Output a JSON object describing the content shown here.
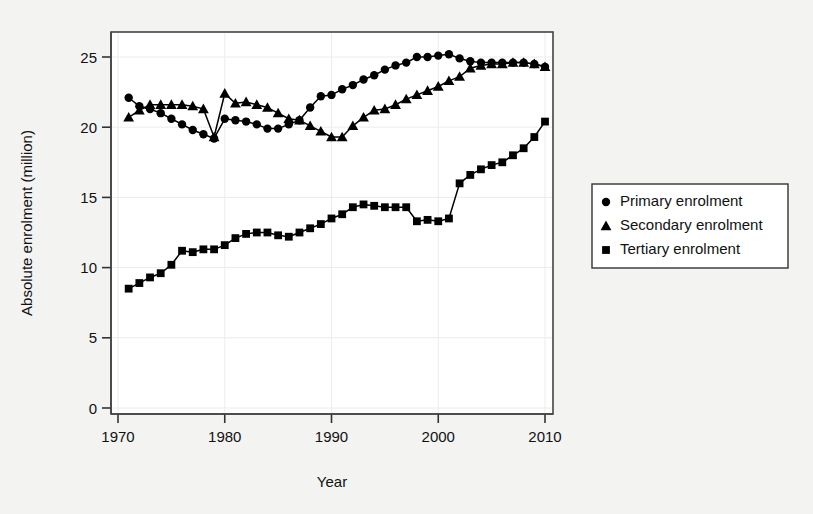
{
  "chart_data": {
    "type": "line",
    "title": "",
    "subtitle": "",
    "xlabel": "Year",
    "ylabel": "Absolute enrolment (million)",
    "xlim": [
      1970,
      2010
    ],
    "ylim": [
      0,
      26
    ],
    "xticks": [
      1970,
      1980,
      1990,
      2000,
      2010
    ],
    "yticks": [
      0,
      5,
      10,
      15,
      20,
      25
    ],
    "xtick_labels": [
      "1970",
      "1980",
      "1990",
      "2000",
      "2010"
    ],
    "ytick_labels": [
      "0",
      "5",
      "10",
      "15",
      "20",
      "25"
    ],
    "grid": false,
    "legend_position": "right",
    "units": "million",
    "marker_color": "#000000",
    "line_color": "#000000",
    "background_color": "#f3f3f1",
    "plot_background_color": "#ffffff",
    "axis_color": "#333333",
    "x": [
      1971,
      1972,
      1973,
      1974,
      1975,
      1976,
      1977,
      1978,
      1979,
      1980,
      1981,
      1982,
      1983,
      1984,
      1985,
      1986,
      1987,
      1988,
      1989,
      1990,
      1991,
      1992,
      1993,
      1994,
      1995,
      1996,
      1997,
      1998,
      1999,
      2000,
      2001,
      2002,
      2003,
      2004,
      2005,
      2006,
      2007,
      2008,
      2009,
      2010
    ],
    "series": [
      {
        "name": "Primary enrolment",
        "marker": "circle",
        "values": [
          22.1,
          21.5,
          21.3,
          21.0,
          20.6,
          20.2,
          19.8,
          19.5,
          19.2,
          20.6,
          20.5,
          20.4,
          20.2,
          19.9,
          19.9,
          20.2,
          20.5,
          21.4,
          22.2,
          22.3,
          22.7,
          23.0,
          23.4,
          23.7,
          24.1,
          24.4,
          24.6,
          25.0,
          25.0,
          25.1,
          25.2,
          24.9,
          24.7,
          24.6,
          24.6,
          24.6,
          24.6,
          24.6,
          24.5,
          24.3
        ]
      },
      {
        "name": "Secondary enrolment",
        "marker": "triangle",
        "values": [
          20.7,
          21.2,
          21.6,
          21.6,
          21.6,
          21.6,
          21.5,
          21.3,
          19.3,
          22.4,
          21.7,
          21.8,
          21.6,
          21.4,
          21.0,
          20.6,
          20.5,
          20.1,
          19.7,
          19.3,
          19.3,
          20.1,
          20.7,
          21.2,
          21.3,
          21.6,
          22.0,
          22.3,
          22.6,
          22.9,
          23.3,
          23.6,
          24.2,
          24.4,
          24.5,
          24.5,
          24.6,
          24.6,
          24.5,
          24.3
        ]
      },
      {
        "name": "Tertiary enrolment",
        "marker": "square",
        "values": [
          8.5,
          8.9,
          9.3,
          9.6,
          10.2,
          11.2,
          11.1,
          11.3,
          11.3,
          11.6,
          12.1,
          12.4,
          12.5,
          12.5,
          12.3,
          12.2,
          12.5,
          12.8,
          13.1,
          13.5,
          13.8,
          14.3,
          14.5,
          14.4,
          14.3,
          14.3,
          14.3,
          13.3,
          13.4,
          13.3,
          13.5,
          16.0,
          16.6,
          17.0,
          17.3,
          17.5,
          18.0,
          18.5,
          19.3,
          20.4
        ]
      }
    ]
  },
  "legend": {
    "entries": [
      {
        "label": "Primary enrolment",
        "marker": "circle-marker"
      },
      {
        "label": "Secondary enrolment",
        "marker": "triangle-marker"
      },
      {
        "label": "Tertiary enrolment",
        "marker": "square-marker"
      }
    ]
  }
}
